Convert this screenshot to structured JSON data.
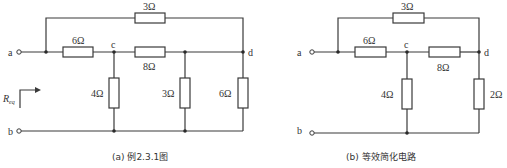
{
  "diagrams": [
    {
      "id": "a",
      "caption": "(a) 例2.3.1图",
      "terminals": {
        "a": "a",
        "b": "b"
      },
      "nodes": {
        "c": "c",
        "d": "d"
      },
      "resistors": {
        "top": "3Ω",
        "a_c": "6Ω",
        "c_d": "8Ω",
        "c_b": "4Ω",
        "mid_b": "3Ω",
        "d_b": "6Ω"
      },
      "req_label": "R",
      "req_sub": "eq"
    },
    {
      "id": "b",
      "caption": "(b) 等效简化电路",
      "terminals": {
        "a": "a",
        "b": "b"
      },
      "nodes": {
        "c": "c",
        "d": "d"
      },
      "resistors": {
        "top": "3Ω",
        "a_c": "6Ω",
        "c_d": "8Ω",
        "c_b": "4Ω",
        "d_b": "2Ω"
      }
    }
  ]
}
